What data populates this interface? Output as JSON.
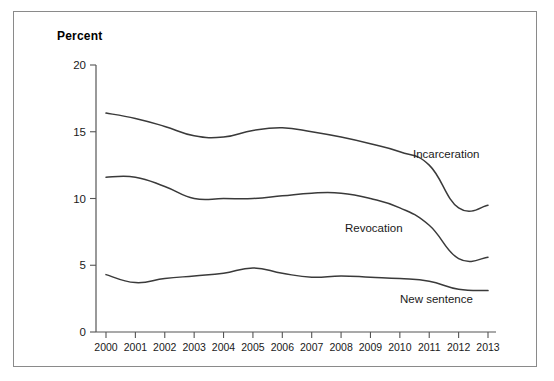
{
  "figure": {
    "axis_title": "Percent",
    "border_color": "#8a8a8a",
    "line_color": "#3a3a3a",
    "axis_color": "#555555"
  },
  "chart_data": {
    "type": "line",
    "title": "",
    "subtitle": "",
    "xlabel": "",
    "ylabel": "Percent",
    "ylim": [
      0,
      20
    ],
    "yticks": [
      0,
      5,
      10,
      15,
      20
    ],
    "ytick_labels": [
      "0",
      "5",
      "10",
      "15",
      "20"
    ],
    "grid": false,
    "legend_position": "inline-right",
    "categories": [
      "2000",
      "2001",
      "2002",
      "2003",
      "2004",
      "2005",
      "2006",
      "2007",
      "2008",
      "2009",
      "2010",
      "2011",
      "2012",
      "2013"
    ],
    "x": [
      2000,
      2001,
      2002,
      2003,
      2004,
      2005,
      2006,
      2007,
      2008,
      2009,
      2010,
      2011,
      2012,
      2013
    ],
    "series": [
      {
        "name": "Incarceration",
        "label": "Incarceration",
        "values": [
          16.4,
          16.0,
          15.4,
          14.7,
          14.6,
          15.1,
          15.3,
          15.0,
          14.6,
          14.1,
          13.5,
          12.5,
          9.3,
          9.5
        ]
      },
      {
        "name": "Revocation",
        "label": "Revocation",
        "values": [
          11.6,
          11.6,
          10.9,
          10.0,
          10.0,
          10.0,
          10.2,
          10.4,
          10.4,
          10.0,
          9.3,
          8.0,
          5.5,
          5.6
        ]
      },
      {
        "name": "New sentence",
        "label": "New sentence",
        "values": [
          4.3,
          3.7,
          4.0,
          4.2,
          4.4,
          4.8,
          4.4,
          4.1,
          4.2,
          4.1,
          4.0,
          3.8,
          3.2,
          3.1
        ]
      }
    ],
    "series_label_positions": [
      {
        "name": "Incarceration",
        "x": 413,
        "y": 158
      },
      {
        "name": "Revocation",
        "x": 345,
        "y": 232
      },
      {
        "name": "New sentence",
        "x": 400,
        "y": 303
      }
    ]
  }
}
